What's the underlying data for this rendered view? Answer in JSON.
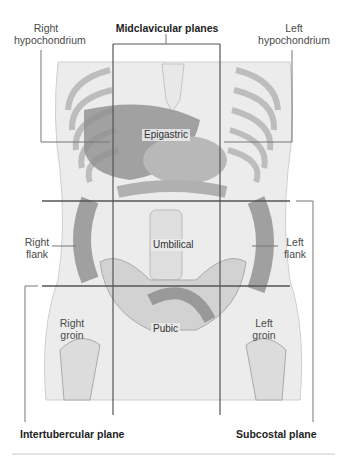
{
  "figure": {
    "header_label": "Midclavicular planes",
    "regions": {
      "right_hypochondrium": "Right\nhypochondrium",
      "left_hypochondrium": "Left\nhypochondrium",
      "epigastric": "Epigastric",
      "right_flank": "Right\nflank",
      "umbilical": "Umbilical",
      "left_flank": "Left\nflank",
      "right_groin": "Right\ngroin",
      "pubic": "Pubic",
      "left_groin": "Left\ngroin"
    },
    "planes": {
      "midclavicular": "Midclavicular planes",
      "intertubercular": "Intertubercular plane",
      "subcostal": "Subcostal plane"
    }
  },
  "colors": {
    "grid_line": "#555555",
    "leader_line": "#777777",
    "bone": "#e2e2e2",
    "organ_dark": "#8a8a8a",
    "organ_mid": "#b5b5b5"
  }
}
